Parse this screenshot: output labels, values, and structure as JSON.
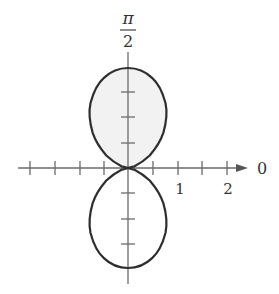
{
  "diagram": {
    "type": "polar-graph",
    "curve": "r = 2 sin^2(theta)",
    "labels": {
      "top_numerator": "π",
      "top_denominator": "2",
      "zero_angle": "0",
      "tick_1": "1",
      "tick_2": "2"
    },
    "origin": [
      128,
      168
    ],
    "scale_px_per_unit": 50,
    "tick_spacing_units": 0.5,
    "colors": {
      "axis": "#6b6b6b",
      "curve": "#2e2e2e",
      "shade": "#f1f1f1",
      "text": "#333333"
    }
  }
}
